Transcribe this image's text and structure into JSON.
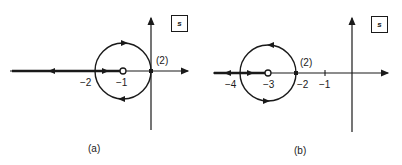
{
  "diagrams": [
    {
      "id": "a",
      "caption": "(a)",
      "plane_label": "s",
      "real_axis_labels": [
        "−2",
        "−1"
      ],
      "multiplicity_label": "(2)",
      "zero_at": -1,
      "double_pole_at": 0
    },
    {
      "id": "b",
      "caption": "(b)",
      "plane_label": "s",
      "real_axis_labels": [
        "−4",
        "−3",
        "−2",
        "−1"
      ],
      "multiplicity_label": "(2)",
      "zero_at": -3,
      "double_pole_at": -2
    }
  ]
}
